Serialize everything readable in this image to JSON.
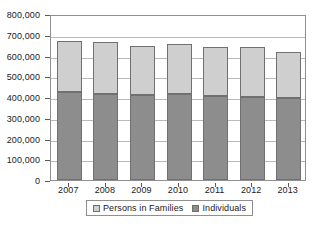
{
  "chart_data": {
    "type": "bar",
    "subtype": "stacked-vertical-bar",
    "title": "",
    "xlabel": "",
    "ylabel": "",
    "categories": [
      "2007",
      "2008",
      "2009",
      "2010",
      "2011",
      "2012",
      "2013"
    ],
    "series": [
      {
        "name": "Persons in Families",
        "color": "#cfcfcf",
        "values": [
          247000,
          252000,
          236000,
          238000,
          235000,
          240000,
          223000
        ]
      },
      {
        "name": "Individuals",
        "color": "#8d8d8d",
        "values": [
          425000,
          415000,
          410000,
          416000,
          407000,
          402000,
          396000
        ]
      }
    ],
    "totals": [
      672000,
      667000,
      646000,
      654000,
      642000,
      642000,
      619000
    ],
    "stack_order": [
      "Individuals",
      "Persons in Families"
    ],
    "ylim": [
      0,
      800000
    ],
    "ytick_values": [
      0,
      100000,
      200000,
      300000,
      400000,
      500000,
      600000,
      700000,
      800000
    ],
    "ytick_labels": [
      "0",
      "100,000",
      "200,000",
      "300,000",
      "400,000",
      "500,000",
      "600,000",
      "700,000",
      "800,000"
    ],
    "grid": true,
    "grid_axis": "y",
    "legend_position": "bottom",
    "legend_entries": [
      "Persons in Families",
      "Individuals"
    ],
    "plot_border": true,
    "colors": {
      "persons_in_families": "#cfcfcf",
      "individuals": "#8d8d8d",
      "gridline": "#b9b9b9",
      "axis": "#8f8f8f",
      "text": "#1a1a1a",
      "background": "#ffffff"
    }
  }
}
